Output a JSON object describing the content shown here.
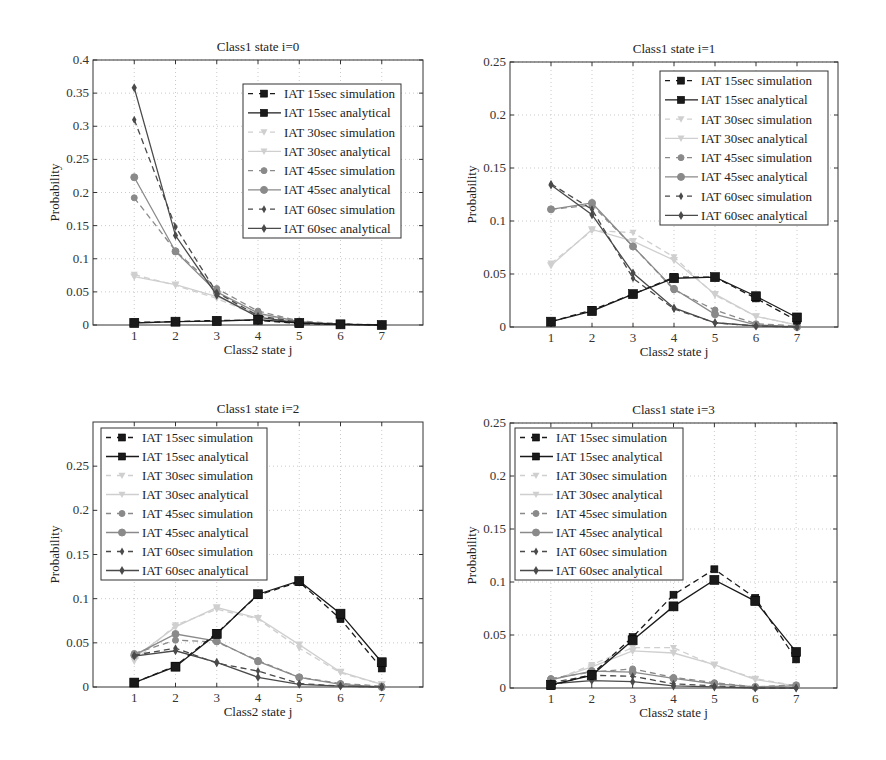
{
  "chart_data": [
    {
      "type": "line",
      "title": "Class1 state i=0",
      "xlabel": "Class2 state j",
      "ylabel": "Probability",
      "x": [
        1,
        2,
        3,
        4,
        5,
        6,
        7
      ],
      "xlim": [
        0,
        8
      ],
      "ylim": [
        0,
        0.4
      ],
      "yticks": [
        0,
        0.05,
        0.1,
        0.15,
        0.2,
        0.25,
        0.3,
        0.35,
        0.4
      ],
      "ytick_labels": [
        "0",
        "0.05",
        "0.1",
        "0.15",
        "0.2",
        "0.25",
        "0.3",
        "0.35",
        "0.4"
      ],
      "grid": true,
      "legend_position": "upper right",
      "series": [
        {
          "name": "IAT 15sec simulation",
          "values": [
            0.004,
            0.005,
            0.007,
            0.007,
            0.002,
            0.001,
            0.0
          ]
        },
        {
          "name": "IAT 15sec analytical",
          "values": [
            0.003,
            0.005,
            0.006,
            0.008,
            0.003,
            0.001,
            0.0
          ]
        },
        {
          "name": "IAT 30sec simulation",
          "values": [
            0.076,
            0.06,
            0.04,
            0.014,
            0.004,
            0.001,
            0.0
          ]
        },
        {
          "name": "IAT 30sec analytical",
          "values": [
            0.073,
            0.061,
            0.043,
            0.016,
            0.005,
            0.001,
            0.0
          ]
        },
        {
          "name": "IAT 45sec simulation",
          "values": [
            0.192,
            0.112,
            0.055,
            0.021,
            0.006,
            0.002,
            0.0
          ]
        },
        {
          "name": "IAT 45sec analytical",
          "values": [
            0.223,
            0.111,
            0.05,
            0.018,
            0.005,
            0.001,
            0.0
          ]
        },
        {
          "name": "IAT 60sec simulation",
          "values": [
            0.31,
            0.148,
            0.049,
            0.014,
            0.004,
            0.001,
            0.0
          ]
        },
        {
          "name": "IAT 60sec analytical",
          "values": [
            0.358,
            0.135,
            0.045,
            0.012,
            0.003,
            0.001,
            0.0
          ]
        }
      ]
    },
    {
      "type": "line",
      "title": "Class1 state i=1",
      "xlabel": "Class2 state j",
      "ylabel": "Probability",
      "x": [
        1,
        2,
        3,
        4,
        5,
        6,
        7
      ],
      "xlim": [
        0,
        8
      ],
      "ylim": [
        0,
        0.25
      ],
      "yticks": [
        0,
        0.05,
        0.1,
        0.15,
        0.2,
        0.25
      ],
      "ytick_labels": [
        "0",
        "0.05",
        "0.1",
        "0.15",
        "0.2",
        "0.25"
      ],
      "grid": true,
      "legend_position": "upper right",
      "series": [
        {
          "name": "IAT 15sec simulation",
          "values": [
            0.005,
            0.016,
            0.031,
            0.047,
            0.047,
            0.027,
            0.006
          ]
        },
        {
          "name": "IAT 15sec analytical",
          "values": [
            0.005,
            0.015,
            0.031,
            0.046,
            0.047,
            0.029,
            0.009
          ]
        },
        {
          "name": "IAT 30sec simulation",
          "values": [
            0.06,
            0.091,
            0.089,
            0.066,
            0.03,
            0.01,
            0.002
          ]
        },
        {
          "name": "IAT 30sec analytical",
          "values": [
            0.058,
            0.092,
            0.081,
            0.063,
            0.031,
            0.01,
            0.002
          ]
        },
        {
          "name": "IAT 45sec simulation",
          "values": [
            0.111,
            0.115,
            0.076,
            0.035,
            0.016,
            0.003,
            0.001
          ]
        },
        {
          "name": "IAT 45sec analytical",
          "values": [
            0.111,
            0.117,
            0.076,
            0.036,
            0.012,
            0.002,
            0.0
          ]
        },
        {
          "name": "IAT 60sec simulation",
          "values": [
            0.135,
            0.111,
            0.046,
            0.017,
            0.004,
            0.001,
            0.0
          ]
        },
        {
          "name": "IAT 60sec analytical",
          "values": [
            0.134,
            0.106,
            0.051,
            0.018,
            0.004,
            0.001,
            0.0
          ]
        }
      ]
    },
    {
      "type": "line",
      "title": "Class1 state i=2",
      "xlabel": "Class2 state j",
      "ylabel": "Probability",
      "x": [
        1,
        2,
        3,
        4,
        5,
        6,
        7
      ],
      "xlim": [
        0,
        8
      ],
      "ylim": [
        0,
        0.3
      ],
      "yticks": [
        0,
        0.05,
        0.1,
        0.15,
        0.2,
        0.25
      ],
      "ytick_labels": [
        "0",
        "0.05",
        "0.1",
        "0.15",
        "0.2",
        "0.25"
      ],
      "grid": true,
      "legend_position": "upper left",
      "series": [
        {
          "name": "IAT 15sec simulation",
          "values": [
            0.005,
            0.024,
            0.061,
            0.104,
            0.119,
            0.077,
            0.021
          ]
        },
        {
          "name": "IAT 15sec analytical",
          "values": [
            0.005,
            0.023,
            0.06,
            0.105,
            0.12,
            0.083,
            0.028
          ]
        },
        {
          "name": "IAT 30sec simulation",
          "values": [
            0.029,
            0.07,
            0.088,
            0.077,
            0.044,
            0.016,
            0.003
          ]
        },
        {
          "name": "IAT 30sec analytical",
          "values": [
            0.033,
            0.068,
            0.09,
            0.078,
            0.048,
            0.017,
            0.003
          ]
        },
        {
          "name": "IAT 45sec simulation",
          "values": [
            0.038,
            0.053,
            0.051,
            0.03,
            0.011,
            0.004,
            0.001
          ]
        },
        {
          "name": "IAT 45sec analytical",
          "values": [
            0.036,
            0.06,
            0.052,
            0.029,
            0.011,
            0.003,
            0.0
          ]
        },
        {
          "name": "IAT 60sec simulation",
          "values": [
            0.036,
            0.044,
            0.027,
            0.018,
            0.004,
            0.001,
            0.0
          ]
        },
        {
          "name": "IAT 60sec analytical",
          "values": [
            0.035,
            0.041,
            0.028,
            0.011,
            0.003,
            0.001,
            0.0
          ]
        }
      ]
    },
    {
      "type": "line",
      "title": "Class1 state i=3",
      "xlabel": "Class2 state j",
      "ylabel": "Probability",
      "x": [
        1,
        2,
        3,
        4,
        5,
        6,
        7
      ],
      "xlim": [
        0,
        8
      ],
      "ylim": [
        0,
        0.25
      ],
      "yticks": [
        0,
        0.05,
        0.1,
        0.15,
        0.2,
        0.25
      ],
      "ytick_labels": [
        "0",
        "0.05",
        "0.1",
        "0.15",
        "0.2",
        "0.25"
      ],
      "grid": true,
      "legend_position": "upper left",
      "series": [
        {
          "name": "IAT 15sec simulation",
          "values": [
            0.002,
            0.013,
            0.048,
            0.088,
            0.112,
            0.085,
            0.027
          ]
        },
        {
          "name": "IAT 15sec analytical",
          "values": [
            0.003,
            0.012,
            0.045,
            0.077,
            0.102,
            0.082,
            0.034
          ]
        },
        {
          "name": "IAT 30sec simulation",
          "values": [
            0.006,
            0.022,
            0.038,
            0.038,
            0.021,
            0.009,
            0.002
          ]
        },
        {
          "name": "IAT 30sec analytical",
          "values": [
            0.007,
            0.02,
            0.035,
            0.033,
            0.022,
            0.008,
            0.002
          ]
        },
        {
          "name": "IAT 45sec simulation",
          "values": [
            0.009,
            0.015,
            0.018,
            0.01,
            0.005,
            0.001,
            0.003
          ]
        },
        {
          "name": "IAT 45sec analytical",
          "values": [
            0.008,
            0.016,
            0.015,
            0.009,
            0.004,
            0.001,
            0.002
          ]
        },
        {
          "name": "IAT 60sec simulation",
          "values": [
            0.005,
            0.012,
            0.011,
            0.004,
            0.002,
            0.0,
            0.0
          ]
        },
        {
          "name": "IAT 60sec analytical",
          "values": [
            0.004,
            0.007,
            0.006,
            0.002,
            0.001,
            0.0,
            0.0
          ]
        }
      ]
    }
  ],
  "series_style": [
    {
      "color": "#1a1a1a",
      "dash": true,
      "marker": "square",
      "msize": 7
    },
    {
      "color": "#1a1a1a",
      "dash": false,
      "marker": "square",
      "msize": 9
    },
    {
      "color": "#cfcfcf",
      "dash": true,
      "marker": "triangle-down",
      "msize": 7
    },
    {
      "color": "#cfcfcf",
      "dash": false,
      "marker": "triangle-down",
      "msize": 8
    },
    {
      "color": "#8a8a8a",
      "dash": true,
      "marker": "circle",
      "msize": 6
    },
    {
      "color": "#8a8a8a",
      "dash": false,
      "marker": "circle",
      "msize": 7
    },
    {
      "color": "#4a4a4a",
      "dash": true,
      "marker": "diamond",
      "msize": 6
    },
    {
      "color": "#4a4a4a",
      "dash": false,
      "marker": "diamond",
      "msize": 7
    }
  ],
  "layout": [
    {
      "left": 93,
      "top": 60,
      "right": 423,
      "bottom": 325,
      "legend": {
        "x": 243,
        "y": 84,
        "w": 158,
        "h": 154
      }
    },
    {
      "left": 510,
      "top": 62,
      "right": 838,
      "bottom": 327,
      "legend": {
        "x": 660,
        "y": 71,
        "w": 168,
        "h": 154
      }
    },
    {
      "left": 93,
      "top": 422,
      "right": 423,
      "bottom": 687,
      "legend": {
        "x": 101,
        "y": 428,
        "w": 166,
        "h": 152
      }
    },
    {
      "left": 510,
      "top": 423,
      "right": 837,
      "bottom": 688,
      "legend": {
        "x": 515,
        "y": 428,
        "w": 168,
        "h": 152
      }
    }
  ]
}
